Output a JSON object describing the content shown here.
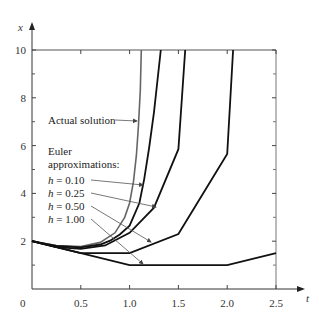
{
  "chart_data": {
    "type": "line",
    "title": "",
    "xlabel": "t",
    "ylabel": "x",
    "xlim": [
      0,
      2.5
    ],
    "ylim": [
      0,
      10
    ],
    "grid": false,
    "x_ticks": [
      0.5,
      1.0,
      1.5,
      2.0,
      2.5
    ],
    "x_tick_labels": [
      "0.5",
      "1.0",
      "1.5",
      "2.0",
      "2.5"
    ],
    "y_ticks": [
      2,
      4,
      6,
      8,
      10
    ],
    "y_tick_labels": [
      "2",
      "4",
      "6",
      "8",
      "10"
    ],
    "y_minor_ticks": [
      1,
      3,
      5,
      7,
      9
    ],
    "origin_label": "0",
    "series": [
      {
        "name": "Actual solution",
        "color": "#666666",
        "width": 1.6,
        "points": [
          [
            0,
            2
          ],
          [
            0.25,
            1.82
          ],
          [
            0.5,
            1.78
          ],
          [
            0.7,
            1.95
          ],
          [
            0.85,
            2.35
          ],
          [
            0.95,
            3.0
          ],
          [
            1.0,
            3.6
          ],
          [
            1.04,
            4.5
          ],
          [
            1.07,
            5.6
          ],
          [
            1.09,
            6.8
          ],
          [
            1.11,
            8.3
          ],
          [
            1.12,
            10
          ]
        ]
      },
      {
        "name": "h = 0.10",
        "color": "#111111",
        "width": 1.8,
        "points": [
          [
            0,
            2
          ],
          [
            0.25,
            1.8
          ],
          [
            0.5,
            1.74
          ],
          [
            0.7,
            1.86
          ],
          [
            0.8,
            2.02
          ],
          [
            0.9,
            2.28
          ],
          [
            1.0,
            2.65
          ],
          [
            1.1,
            3.6
          ],
          [
            1.15,
            4.6
          ],
          [
            1.2,
            5.9
          ],
          [
            1.25,
            7.4
          ],
          [
            1.32,
            10
          ]
        ]
      },
      {
        "name": "h = 0.25",
        "color": "#111111",
        "width": 1.8,
        "points": [
          [
            0,
            2
          ],
          [
            0.25,
            1.75
          ],
          [
            0.5,
            1.68
          ],
          [
            0.75,
            1.82
          ],
          [
            1.0,
            2.35
          ],
          [
            1.25,
            3.4
          ],
          [
            1.5,
            5.85
          ],
          [
            1.57,
            10
          ]
        ]
      },
      {
        "name": "h = 0.50",
        "color": "#111111",
        "width": 1.8,
        "points": [
          [
            0,
            2
          ],
          [
            0.5,
            1.5
          ],
          [
            1.0,
            1.5
          ],
          [
            1.5,
            2.3
          ],
          [
            2.0,
            5.65
          ],
          [
            2.06,
            10
          ]
        ]
      },
      {
        "name": "h = 1.00",
        "color": "#111111",
        "width": 1.8,
        "points": [
          [
            0,
            2
          ],
          [
            1.0,
            1.0
          ],
          [
            2.0,
            1.0
          ],
          [
            2.5,
            1.5
          ]
        ]
      }
    ],
    "annotations": [
      {
        "text": "Actual solution",
        "italic_prefix": "",
        "x": 48,
        "y": 124,
        "arrow_from": [
          115,
          120
        ],
        "arrow_to": [
          137,
          121
        ]
      },
      {
        "text": "Euler",
        "italic_prefix": "",
        "x": 48,
        "y": 155
      },
      {
        "text": "approximations:",
        "italic_prefix": "",
        "x": 48,
        "y": 168
      },
      {
        "text": " = 0.10",
        "italic_prefix": "h",
        "x": 48,
        "y": 184,
        "arrow_from": [
          91,
          180
        ],
        "arrow_to": [
          143,
          185
        ]
      },
      {
        "text": " = 0.25",
        "italic_prefix": "h",
        "x": 48,
        "y": 197,
        "arrow_from": [
          91,
          193
        ],
        "arrow_to": [
          156,
          207
        ]
      },
      {
        "text": " = 0.50",
        "italic_prefix": "h",
        "x": 48,
        "y": 210,
        "arrow_from": [
          91,
          206
        ],
        "arrow_to": [
          151,
          242
        ]
      },
      {
        "text": " = 1.00",
        "italic_prefix": "h",
        "x": 48,
        "y": 223,
        "arrow_from": [
          91,
          219
        ],
        "arrow_to": [
          143,
          264
        ]
      }
    ]
  }
}
